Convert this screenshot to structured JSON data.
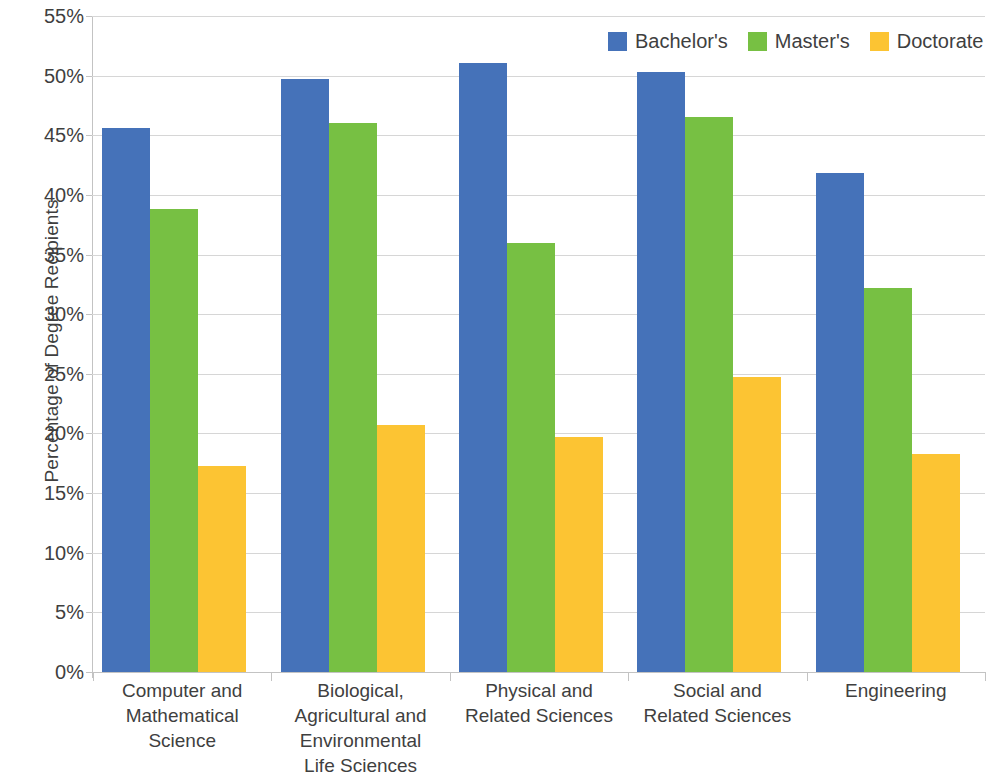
{
  "chart_data": {
    "type": "bar",
    "title": "",
    "xlabel": "",
    "ylabel": "Percentage of Degree Recipients",
    "ylim": [
      0,
      55
    ],
    "ytick_values": [
      0,
      5,
      10,
      15,
      20,
      25,
      30,
      35,
      40,
      45,
      50,
      55
    ],
    "ytick_labels": [
      "0%",
      "5%",
      "10%",
      "15%",
      "20%",
      "25%",
      "30%",
      "35%",
      "40%",
      "45%",
      "50%",
      "55%"
    ],
    "grid": true,
    "legend_position": "top-right",
    "categories": [
      "Computer and Mathematical Science",
      "Biological, Agricultural and Environmental Life Sciences",
      "Physical and Related Sciences",
      "Social and Related Sciences",
      "Engineering"
    ],
    "category_label_lines": [
      [
        "Computer and",
        "Mathematical",
        "Science"
      ],
      [
        "Biological,",
        "Agricultural and",
        "Environmental",
        "Life Sciences"
      ],
      [
        "Physical and",
        "Related Sciences"
      ],
      [
        "Social and",
        "Related Sciences"
      ],
      [
        "Engineering"
      ]
    ],
    "series": [
      {
        "name": "Bachelor's",
        "color": "#4572b9",
        "values": [
          45.6,
          49.7,
          51.1,
          50.3,
          41.8
        ]
      },
      {
        "name": "Master's",
        "color": "#77c043",
        "values": [
          38.8,
          46.0,
          36.0,
          46.5,
          32.2
        ]
      },
      {
        "name": "Doctorate",
        "color": "#fcc433",
        "values": [
          17.3,
          20.7,
          19.7,
          24.7,
          18.3
        ]
      }
    ]
  },
  "legend": {
    "items": [
      {
        "label": "Bachelor's",
        "color": "#4572b9"
      },
      {
        "label": "Master's",
        "color": "#77c043"
      },
      {
        "label": "Doctorate",
        "color": "#fcc433"
      }
    ]
  }
}
